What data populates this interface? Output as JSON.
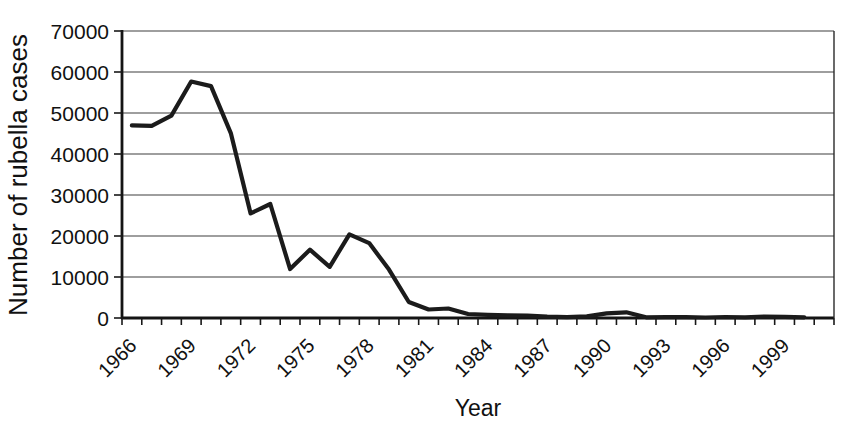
{
  "chart_data": {
    "type": "line",
    "title": "",
    "xlabel": "Year",
    "ylabel": "Number of rubella cases",
    "x": [
      1966,
      1967,
      1968,
      1969,
      1970,
      1971,
      1972,
      1973,
      1974,
      1975,
      1976,
      1977,
      1978,
      1979,
      1980,
      1981,
      1982,
      1983,
      1984,
      1985,
      1986,
      1987,
      1988,
      1989,
      1990,
      1991,
      1992,
      1993,
      1994,
      1995,
      1996,
      1997,
      1998,
      1999,
      2000
    ],
    "series": [
      {
        "name": "Number of rubella cases",
        "values": [
          46975,
          46888,
          49371,
          57686,
          56552,
          45086,
          25507,
          27804,
          11917,
          16652,
          12491,
          20395,
          18269,
          11795,
          3904,
          2077,
          2325,
          970,
          752,
          630,
          551,
          306,
          225,
          396,
          1125,
          1401,
          160,
          192,
          227,
          128,
          238,
          181,
          364,
          267,
          176
        ]
      }
    ],
    "ylim": [
      0,
      70000
    ],
    "yticks": [
      0,
      10000,
      20000,
      30000,
      40000,
      50000,
      60000,
      70000
    ],
    "xtick_labels": [
      "1966",
      "1969",
      "1972",
      "1975",
      "1978",
      "1981",
      "1984",
      "1987",
      "1990",
      "1993",
      "1996",
      "1999"
    ],
    "xtick_label_interval": 3,
    "axis_categories": 36,
    "grid": true,
    "legend_position": "none",
    "line_color": "#1b1b1b",
    "background_color": "#ffffff",
    "text_color": "#111111"
  }
}
